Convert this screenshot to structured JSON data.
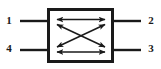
{
  "figure": {
    "type": "four-port-network-schematic",
    "background_color": "#ffffff",
    "stroke_color": "#1a1a1a",
    "box": {
      "x": 47,
      "y": 8,
      "width": 67,
      "height": 55,
      "border_width": 3,
      "fill": "#ffffff"
    },
    "ports": [
      {
        "id": "port-1",
        "label": "1",
        "side": "left",
        "position": "top",
        "lead": {
          "x1": 20,
          "y1": 21,
          "x2": 47,
          "y2": 21
        }
      },
      {
        "id": "port-2",
        "label": "2",
        "side": "right",
        "position": "top",
        "lead": {
          "x1": 114,
          "y1": 21,
          "x2": 141,
          "y2": 21
        }
      },
      {
        "id": "port-3",
        "label": "3",
        "side": "right",
        "position": "bottom",
        "lead": {
          "x1": 114,
          "y1": 50,
          "x2": 141,
          "y2": 50
        }
      },
      {
        "id": "port-4",
        "label": "4",
        "side": "left",
        "position": "bottom",
        "lead": {
          "x1": 20,
          "y1": 50,
          "x2": 47,
          "y2": 50
        }
      }
    ],
    "couplings": [
      {
        "id": "coupling-top",
        "from": "port-1",
        "to": "port-2",
        "style": "double-headed-horizontal",
        "x1": 56,
        "y1": 19,
        "x2": 106,
        "y2": 19
      },
      {
        "id": "coupling-bottom",
        "from": "port-4",
        "to": "port-3",
        "style": "double-headed-horizontal",
        "x1": 56,
        "y1": 52,
        "x2": 106,
        "y2": 52
      },
      {
        "id": "coupling-diagonal-down",
        "from": "port-1",
        "to": "port-3",
        "style": "double-headed-diagonal",
        "x1": 56,
        "y1": 24,
        "x2": 106,
        "y2": 47
      },
      {
        "id": "coupling-diagonal-up",
        "from": "port-4",
        "to": "port-2",
        "style": "double-headed-diagonal",
        "x1": 56,
        "y1": 47,
        "x2": 106,
        "y2": 24
      }
    ]
  }
}
